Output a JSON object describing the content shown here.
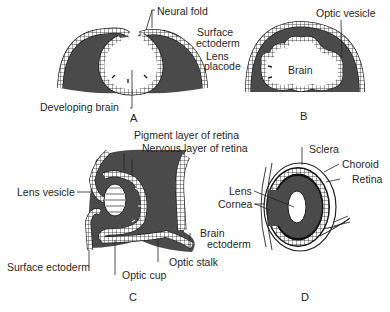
{
  "figure": {
    "panels": [
      {
        "id": "A",
        "letter": "A",
        "labels": [
          "Neural fold",
          "Surface ectoderm",
          "Lens placode",
          "Developing brain"
        ]
      },
      {
        "id": "B",
        "letter": "B",
        "labels": [
          "Optic vesicle",
          "Brain"
        ]
      },
      {
        "id": "C",
        "letter": "C",
        "labels": [
          "Pigment layer of retina",
          "Nervous layer of retina",
          "Lens vesicle",
          "Brain ectoderm",
          "Optic stalk",
          "Surface ectoderm",
          "Optic cup"
        ]
      },
      {
        "id": "D",
        "letter": "D",
        "labels": [
          "Sclera",
          "Choroid",
          "Retina",
          "Lens",
          "Cornea"
        ]
      }
    ]
  },
  "labels": {
    "neural_fold": "Neural fold",
    "surface_ectoderm_ab_1": "Surface",
    "surface_ectoderm_ab_2": "ectoderm",
    "lens_placode_1": "Lens",
    "lens_placode_2": "placode",
    "developing_brain": "Developing brain",
    "optic_vesicle": "Optic vesicle",
    "brain": "Brain",
    "pigment_layer": "Pigment layer of retina",
    "nervous_layer": "Nervous layer of retina",
    "lens_vesicle": "Lens vesicle",
    "brain_ectoderm_1": "Brain",
    "brain_ectoderm_2": "ectoderm",
    "optic_stalk": "Optic stalk",
    "surface_ectoderm_c": "Surface ectoderm",
    "optic_cup": "Optic cup",
    "sclera": "Sclera",
    "choroid": "Choroid",
    "retina": "Retina",
    "lens": "Lens",
    "cornea": "Cornea",
    "letter_a": "A",
    "letter_b": "B",
    "letter_c": "C",
    "letter_d": "D"
  },
  "colors": {
    "tissue_fill": "#4a4a4a",
    "cell_layer": "#ffffff",
    "outline": "#1a1a1a",
    "background": "#ffffff"
  }
}
